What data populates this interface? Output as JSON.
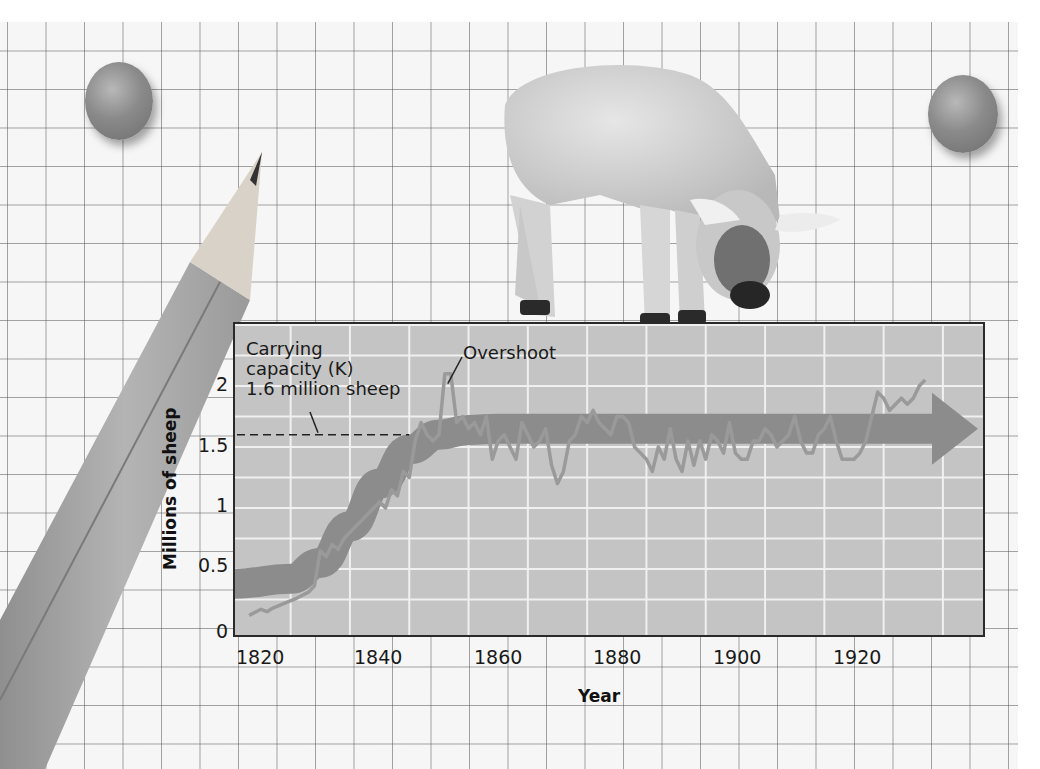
{
  "chart_data": {
    "type": "line",
    "title": "",
    "xlabel": "Year",
    "ylabel": "Millions of sheep",
    "x_ticks": [
      "1820",
      "1840",
      "1860",
      "1880",
      "1900",
      "1920"
    ],
    "y_ticks": [
      "0",
      "0.5",
      "1",
      "1.5",
      "2"
    ],
    "xlim": [
      1815,
      1945
    ],
    "ylim": [
      0,
      2.3
    ],
    "grid": true,
    "carrying_capacity": {
      "label_line1": "Carrying",
      "label_line2": "capacity (K)",
      "label_line3": "1.6 million sheep",
      "value": 1.6
    },
    "overshoot_label": "Overshoot",
    "series": [
      {
        "name": "Sheep population (observed)",
        "x": [
          1818,
          1820,
          1821,
          1822,
          1824,
          1826,
          1828,
          1829,
          1830,
          1831,
          1832,
          1833,
          1834,
          1835,
          1836,
          1837,
          1838,
          1839,
          1840,
          1841,
          1842,
          1843,
          1844,
          1845,
          1846,
          1847,
          1848,
          1849,
          1850,
          1851,
          1852,
          1853,
          1854,
          1855,
          1856,
          1857,
          1858,
          1859,
          1860,
          1861,
          1862,
          1863,
          1864,
          1865,
          1866,
          1867,
          1868,
          1869,
          1870,
          1871,
          1872,
          1873,
          1874,
          1875,
          1876,
          1877,
          1878,
          1879,
          1880,
          1881,
          1882,
          1883,
          1884,
          1885,
          1886,
          1887,
          1888,
          1889,
          1890,
          1891,
          1892,
          1893,
          1894,
          1895,
          1896,
          1897,
          1898,
          1899,
          1900,
          1901,
          1902,
          1903,
          1904,
          1905,
          1906,
          1907,
          1908,
          1909,
          1910,
          1911,
          1912,
          1913,
          1914,
          1915,
          1916,
          1917,
          1918,
          1919,
          1920,
          1921,
          1922,
          1923,
          1924,
          1925,
          1926,
          1927,
          1928,
          1929,
          1930,
          1931,
          1932
        ],
        "values": [
          0.12,
          0.17,
          0.15,
          0.18,
          0.22,
          0.26,
          0.31,
          0.36,
          0.65,
          0.6,
          0.7,
          0.66,
          0.75,
          0.8,
          0.85,
          0.9,
          0.95,
          1.0,
          1.05,
          1.0,
          1.15,
          1.1,
          1.3,
          1.25,
          1.55,
          1.7,
          1.6,
          1.55,
          1.6,
          2.1,
          2.1,
          1.7,
          1.75,
          1.65,
          1.7,
          1.6,
          1.75,
          1.4,
          1.55,
          1.6,
          1.5,
          1.4,
          1.7,
          1.6,
          1.5,
          1.55,
          1.65,
          1.35,
          1.2,
          1.3,
          1.55,
          1.6,
          1.75,
          1.7,
          1.8,
          1.7,
          1.65,
          1.6,
          1.75,
          1.75,
          1.7,
          1.5,
          1.45,
          1.4,
          1.3,
          1.5,
          1.4,
          1.65,
          1.4,
          1.3,
          1.55,
          1.35,
          1.55,
          1.4,
          1.6,
          1.55,
          1.45,
          1.7,
          1.45,
          1.4,
          1.4,
          1.55,
          1.55,
          1.65,
          1.6,
          1.5,
          1.55,
          1.6,
          1.75,
          1.55,
          1.45,
          1.45,
          1.6,
          1.65,
          1.75,
          1.55,
          1.4,
          1.4,
          1.4,
          1.45,
          1.55,
          1.75,
          1.95,
          1.9,
          1.8,
          1.85,
          1.9,
          1.85,
          1.9,
          2.0,
          2.05
        ]
      },
      {
        "name": "Logistic trend (arrow)",
        "x": [
          1815,
          1825,
          1830,
          1835,
          1840,
          1845,
          1850,
          1855,
          1860,
          1880,
          1900,
          1920,
          1938
        ],
        "values": [
          0.38,
          0.42,
          0.55,
          0.85,
          1.2,
          1.48,
          1.6,
          1.64,
          1.65,
          1.65,
          1.65,
          1.65,
          1.65
        ]
      }
    ],
    "legend": null
  },
  "colors": {
    "plot_bg": "#c4c4c4",
    "grid": "#f0f0f0",
    "trend_band": "#8c8c8c",
    "data_line": "#9a9a9a",
    "axis": "#2a2a2a"
  },
  "decorations": {
    "pins": [
      "push-pin-left",
      "push-pin-right"
    ],
    "pencil": "pencil",
    "photo": "lamb"
  }
}
